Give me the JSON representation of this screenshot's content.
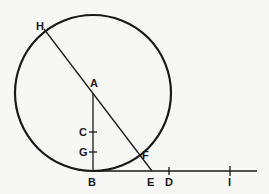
{
  "diagram": {
    "stroke_color": "#1a1a1a",
    "background": "#f7f7f5",
    "circle": {
      "center": "A",
      "cx": 93,
      "cy": 93,
      "r": 78
    },
    "points": {
      "H": {
        "label": "H",
        "x": 44,
        "y": 29,
        "lx": 28,
        "ly": 26
      },
      "A": {
        "label": "A",
        "x": 93,
        "y": 93,
        "lx": 90,
        "ly": 86
      },
      "C": {
        "label": "C",
        "x": 93,
        "y": 132,
        "lx": 79,
        "ly": 136
      },
      "G": {
        "label": "G",
        "x": 93,
        "y": 152,
        "lx": 79,
        "ly": 156
      },
      "F": {
        "label": "F",
        "x": 139,
        "y": 153,
        "lx": 143,
        "ly": 158
      },
      "B": {
        "label": "B",
        "x": 93,
        "y": 171,
        "lx": 88,
        "ly": 186
      },
      "E": {
        "label": "E",
        "x": 152,
        "y": 171,
        "lx": 147,
        "ly": 186
      },
      "D": {
        "label": "D",
        "x": 169,
        "y": 171,
        "lx": 165,
        "ly": 186
      },
      "I": {
        "label": "I",
        "x": 230,
        "y": 171,
        "lx": 227,
        "ly": 186
      }
    },
    "segments": [
      {
        "from": "H",
        "to": "E"
      },
      {
        "from": "A",
        "to": "B"
      },
      {
        "from": "B",
        "to": "end",
        "x2": 257
      }
    ],
    "ticks": [
      "C",
      "G",
      "D",
      "I"
    ]
  }
}
